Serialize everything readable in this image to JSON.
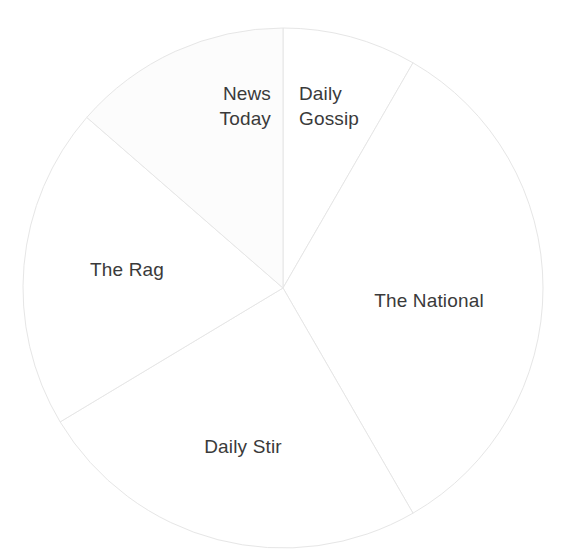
{
  "chart_data": {
    "type": "pie",
    "title": "",
    "subtitle": "",
    "xlabel": "",
    "ylabel": "",
    "legend_position": "none",
    "grid": false,
    "labels_inside": true,
    "start_angle_deg": 0,
    "direction": "clockwise",
    "center": {
      "x": 283,
      "y": 288
    },
    "radius": 260,
    "categories": [
      "Daily Gossip",
      "The National",
      "Daily Stir",
      "The Rag",
      "News Today"
    ],
    "values": [
      8.3,
      33.3,
      24.7,
      20.0,
      13.7
    ],
    "value_unit": "percent",
    "slices": [
      {
        "name": "Daily Gossip",
        "label_lines": [
          "Daily",
          "Gossip"
        ],
        "value": 8.3,
        "angle_deg": 30,
        "start_angle_deg": 0,
        "end_angle_deg": 30,
        "fill": "#ffffff",
        "stroke": "#e6e6e6",
        "label_x": 299,
        "label_y": 100,
        "label_anchor": "start"
      },
      {
        "name": "The National",
        "label_lines": [
          "The National"
        ],
        "value": 33.3,
        "angle_deg": 120,
        "start_angle_deg": 30,
        "end_angle_deg": 150,
        "fill": "#ffffff",
        "stroke": "#e6e6e6",
        "label_x": 429,
        "label_y": 307,
        "label_anchor": "middle"
      },
      {
        "name": "Daily Stir",
        "label_lines": [
          "Daily Stir"
        ],
        "value": 24.7,
        "angle_deg": 89,
        "start_angle_deg": 150,
        "end_angle_deg": 239,
        "fill": "#ffffff",
        "stroke": "#e6e6e6",
        "label_x": 243,
        "label_y": 453,
        "label_anchor": "middle"
      },
      {
        "name": "The Rag",
        "label_lines": [
          "The Rag"
        ],
        "value": 20.0,
        "angle_deg": 72,
        "start_angle_deg": 239,
        "end_angle_deg": 311,
        "fill": "#ffffff",
        "stroke": "#e6e6e6",
        "label_x": 127,
        "label_y": 276,
        "label_anchor": "middle"
      },
      {
        "name": "News Today",
        "label_lines": [
          "News",
          "Today"
        ],
        "value": 13.7,
        "angle_deg": 49,
        "start_angle_deg": 311,
        "end_angle_deg": 360,
        "fill": "#fcfcfc",
        "stroke": "#e6e6e6",
        "label_x": 271,
        "label_y": 100,
        "label_anchor": "end"
      }
    ],
    "colors": {
      "background": "#ffffff",
      "slice_stroke": "#e6e6e6",
      "label_text": "#3a3a3a",
      "highlight_slice_fill": "#fcfcfc"
    }
  }
}
